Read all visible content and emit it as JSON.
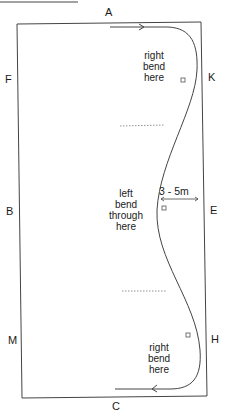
{
  "diagram": {
    "type": "dressage-arena-serpentine",
    "markers": {
      "A": "A",
      "K": "K",
      "E": "E",
      "H": "H",
      "C": "C",
      "M": "M",
      "B": "B",
      "F": "F"
    },
    "annotations": {
      "top_bend": [
        "right",
        "bend",
        "here"
      ],
      "middle_bend": [
        "left",
        "bend",
        "through",
        "here"
      ],
      "bottom_bend": [
        "right",
        "bend",
        "here"
      ],
      "distance": "3 - 5m"
    },
    "colors": {
      "line": "#333333",
      "background": "#ffffff"
    }
  }
}
